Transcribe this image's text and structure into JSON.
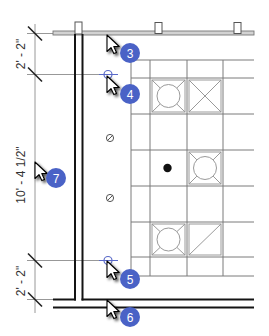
{
  "drawing": {
    "dimensions": [
      {
        "label": "2' - 2\""
      },
      {
        "label": "10' - 4 1/2\""
      },
      {
        "label": "2' - 2\""
      }
    ],
    "callouts": [
      {
        "number": "3",
        "target": "top wall edge"
      },
      {
        "number": "4",
        "target": "upper dimension grip"
      },
      {
        "number": "7",
        "target": "dimension line"
      },
      {
        "number": "5",
        "target": "lower dimension grip"
      },
      {
        "number": "6",
        "target": "bottom wall edge"
      }
    ],
    "ceiling_fixtures": [
      {
        "row": 1,
        "col": 1,
        "type": "circle-in-square light"
      },
      {
        "row": 1,
        "col": 2,
        "type": "square with X"
      },
      {
        "row": 3,
        "col": 1,
        "type": "solid dot"
      },
      {
        "row": 3,
        "col": 2,
        "type": "circle-in-square light"
      },
      {
        "row": 5,
        "col": 1,
        "type": "circle-in-square light"
      },
      {
        "row": 5,
        "col": 2,
        "type": "square with diagonal"
      }
    ],
    "wall_symbols": [
      {
        "type": "slashed-circle"
      },
      {
        "type": "slashed-circle"
      }
    ]
  },
  "colors": {
    "callout_badge": "#4a62c6",
    "grip": "#5a6ac8",
    "wall": "#141414",
    "grid": "#7a7a7a",
    "background": "#ffffff"
  }
}
